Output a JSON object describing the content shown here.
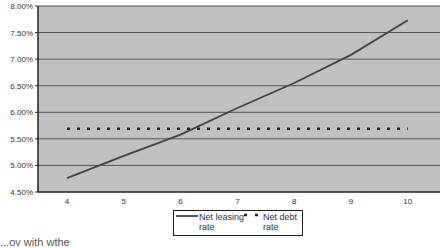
{
  "chart_data": {
    "type": "line",
    "title": "",
    "xlabel": "",
    "ylabel": "",
    "x": [
      4,
      5,
      6,
      7,
      8,
      9,
      10
    ],
    "series": [
      {
        "name": "Net leasing rate",
        "style": "solid",
        "color": "#444444",
        "values": [
          4.76,
          5.18,
          5.58,
          6.08,
          6.55,
          7.08,
          7.73
        ]
      },
      {
        "name": "Net debt rate",
        "style": "dotted",
        "color": "#222222",
        "values": [
          5.69,
          5.69,
          5.69,
          5.69,
          5.69,
          5.69,
          5.69
        ]
      }
    ],
    "ylim": [
      4.5,
      8.0
    ],
    "yticks": [
      "4.50%",
      "5.00%",
      "5.50%",
      "6.00%",
      "6.50%",
      "7.00%",
      "7.50%",
      "8.00%"
    ],
    "xticks": [
      "4",
      "5",
      "6",
      "7",
      "8",
      "9",
      "10"
    ],
    "grid": true,
    "legend_position": "bottom",
    "plot_background": "#c0c0c0"
  },
  "legend": {
    "leasing_line1": "Net leasing",
    "leasing_line2": "rate",
    "debt_line1": "Net debt",
    "debt_line2": "rate"
  },
  "caption": "...ov with wthe"
}
